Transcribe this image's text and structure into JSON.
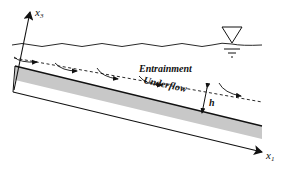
{
  "diagram": {
    "type": "schematic",
    "labels": {
      "x3_axis": "x",
      "x3_sub": "3",
      "x1_axis": "x",
      "x1_sub": "1",
      "entrainment": "Entrainment",
      "underflow": "Underflow",
      "thickness": "h"
    },
    "elements": [
      {
        "id": "free-surface",
        "kind": "wavy-line"
      },
      {
        "id": "water-level-symbol",
        "kind": "inverted-triangle"
      },
      {
        "id": "interface",
        "kind": "dashed-line"
      },
      {
        "id": "bed",
        "kind": "gray-band"
      },
      {
        "id": "x1-axis",
        "kind": "arrow"
      },
      {
        "id": "x3-axis",
        "kind": "arrow"
      },
      {
        "id": "flow-arrows",
        "kind": "curved-arrows",
        "count": 5
      },
      {
        "id": "thickness-arrow",
        "kind": "double-arrow"
      }
    ],
    "colors": {
      "ink": "#111111",
      "bed_fill": "#c8c8c8",
      "background": "#ffffff"
    }
  }
}
